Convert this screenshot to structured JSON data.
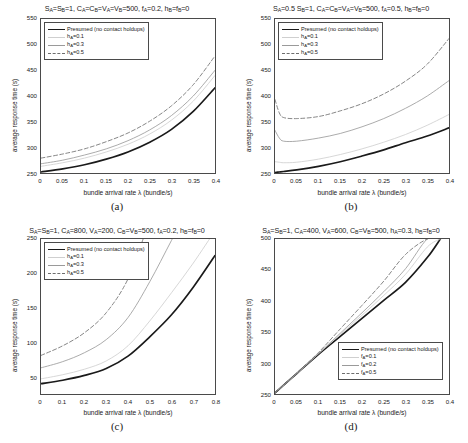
{
  "figure": {
    "axis_labels": {
      "x": "bundle arrival rate λ (bundle/s)",
      "y": "average response time (s)"
    },
    "series_styles": {
      "presumed": "#1a1a1a",
      "light_gray": "#cfcfcf",
      "mid_gray": "#9a9a9a",
      "dashed_gray": "#6e6e6e"
    }
  },
  "panels": [
    {
      "id": "a",
      "caption": "(a)",
      "title_html": "S<sub>A</sub>=S<sub>B</sub>=1, C<sub>A</sub>=C<sub>B</sub>=V<sub>A</sub>=V<sub>B</sub>=500, f<sub>A</sub>=0.2, h<sub>B</sub>=f<sub>B</sub>=0",
      "chart_data": {
        "type": "line",
        "title": "S_A=S_B=1, C_A=C_B=V_A=V_B=500, f_A=0.2, h_B=f_B=0",
        "xlabel": "bundle arrival rate λ (bundle/s)",
        "ylabel": "average response time (s)",
        "xlim": [
          0,
          0.4
        ],
        "ylim": [
          250,
          550
        ],
        "xticks": [
          0,
          0.05,
          0.1,
          0.15,
          0.2,
          0.25,
          0.3,
          0.35,
          0.4
        ],
        "xticklabels": [
          "0",
          "0.05",
          "0.1",
          "0.15",
          "0.2",
          "0.25",
          "0.3",
          "0.35",
          "0.4"
        ],
        "yticks": [
          250,
          300,
          350,
          400,
          450,
          500,
          550
        ],
        "yticklabels": [
          "250",
          "300",
          "350",
          "400",
          "450",
          "500",
          "550"
        ],
        "grid": false,
        "legend_position": "upper left",
        "x": [
          0,
          0.05,
          0.1,
          0.15,
          0.2,
          0.25,
          0.3,
          0.35,
          0.4
        ],
        "series": [
          {
            "name": "Presumed (no contact holdups)",
            "style": "solid-thick",
            "color": "#1a1a1a",
            "values": [
              252,
              258,
              266,
              277,
              291,
              310,
              335,
              370,
              416
            ]
          },
          {
            "name": "h_A=0.1",
            "style": "solid-thin",
            "color": "#cfcfcf",
            "values": [
              263,
              270,
              279,
              291,
              306,
              326,
              353,
              390,
              440
            ]
          },
          {
            "name": "h_A=0.3",
            "style": "solid-thin",
            "color": "#9a9a9a",
            "values": [
              268,
              275,
              285,
              297,
              313,
              334,
              362,
              400,
              450
            ]
          },
          {
            "name": "h_A=0.5",
            "style": "dashed",
            "color": "#6e6e6e",
            "values": [
              279,
              287,
              297,
              311,
              328,
              351,
              381,
              422,
              478
            ]
          }
        ]
      },
      "legend": [
        {
          "label_html": "Presumed (no contact holdups)",
          "style": "solid-thick",
          "color": "#1a1a1a"
        },
        {
          "label_html": "h<sub>A</sub>=0.1",
          "style": "solid-thin",
          "color": "#cfcfcf"
        },
        {
          "label_html": "h<sub>A</sub>=0.3",
          "style": "solid-thin",
          "color": "#9a9a9a"
        },
        {
          "label_html": "h<sub>A</sub>=0.5",
          "style": "dashed",
          "color": "#6e6e6e"
        }
      ]
    },
    {
      "id": "b",
      "caption": "(b)",
      "title_html": "S<sub>A</sub>=0.5 S<sub>B</sub>=1, C<sub>A</sub>=C<sub>B</sub>=V<sub>A</sub>=V<sub>B</sub>=500, f<sub>A</sub>=0.5, h<sub>B</sub>=f<sub>B</sub>=0",
      "chart_data": {
        "type": "line",
        "title": "S_A=0.5 S_B=1, C_A=C_B=V_A=V_B=500, f_A=0.5, h_B=f_B=0",
        "xlabel": "bundle arrival rate λ (bundle/s)",
        "ylabel": "average response time (s)",
        "xlim": [
          0,
          0.4
        ],
        "ylim": [
          250,
          550
        ],
        "xticks": [
          0,
          0.05,
          0.1,
          0.15,
          0.2,
          0.25,
          0.3,
          0.35,
          0.4
        ],
        "xticklabels": [
          "0",
          "0.05",
          "0.1",
          "0.15",
          "0.2",
          "0.25",
          "0.3",
          "0.35",
          "0.4"
        ],
        "yticks": [
          250,
          300,
          350,
          400,
          450,
          500,
          550
        ],
        "yticklabels": [
          "250",
          "300",
          "350",
          "400",
          "450",
          "500",
          "550"
        ],
        "grid": false,
        "legend_position": "upper left",
        "x": [
          0,
          0.01,
          0.02,
          0.05,
          0.1,
          0.15,
          0.2,
          0.25,
          0.3,
          0.35,
          0.4
        ],
        "series": [
          {
            "name": "Presumed (no contact holdups)",
            "style": "solid-thick",
            "color": "#1a1a1a",
            "values": [
              251,
              252,
              253,
              256,
              263,
              272,
              283,
              295,
              309,
              322,
              338
            ]
          },
          {
            "name": "h_A=0.1",
            "style": "solid-thin",
            "color": "#cfcfcf",
            "values": [
              272,
              271,
              270,
              271,
              277,
              286,
              297,
              310,
              325,
              343,
              364
            ]
          },
          {
            "name": "h_A=0.3",
            "style": "solid-thin",
            "color": "#9a9a9a",
            "values": [
              333,
              318,
              312,
              312,
              318,
              327,
              340,
              356,
              376,
              400,
              430
            ]
          },
          {
            "name": "h_A=0.5",
            "style": "dashed",
            "color": "#6e6e6e",
            "values": [
              393,
              367,
              358,
              356,
              360,
              371,
              385,
              404,
              429,
              462,
              512
            ]
          }
        ]
      },
      "legend": [
        {
          "label_html": "Presumed (no contact holdups)",
          "style": "solid-thick",
          "color": "#1a1a1a"
        },
        {
          "label_html": "h<sub>A</sub>=0.1",
          "style": "solid-thin",
          "color": "#cfcfcf"
        },
        {
          "label_html": "h<sub>A</sub>=0.3",
          "style": "solid-thin",
          "color": "#9a9a9a"
        },
        {
          "label_html": "h<sub>A</sub>=0.5",
          "style": "dashed",
          "color": "#6e6e6e"
        }
      ]
    },
    {
      "id": "c",
      "caption": "(c)",
      "title_html": "S<sub>A</sub>=S<sub>B</sub>=1, C<sub>A</sub>=800, V<sub>A</sub>=200, C<sub>B</sub>=V<sub>B</sub>=500, f<sub>A</sub>=0.2, h<sub>B</sub>=f<sub>B</sub>=0",
      "chart_data": {
        "type": "line",
        "title": "S_A=S_B=1, C_A=800, V_A=200, C_B=V_B=500, f_A=0.2, h_B=f_B=0",
        "xlabel": "bundle arrival rate λ (bundle/s)",
        "ylabel": "average response time (s)",
        "xlim": [
          0,
          0.8
        ],
        "ylim": [
          25,
          250
        ],
        "xticks": [
          0,
          0.1,
          0.2,
          0.3,
          0.4,
          0.5,
          0.6,
          0.7,
          0.8
        ],
        "xticklabels": [
          "0",
          "0.1",
          "0.2",
          "0.3",
          "0.4",
          "0.5",
          "0.6",
          "0.7",
          "0.8"
        ],
        "yticks": [
          50,
          100,
          150,
          200,
          250
        ],
        "yticklabels": [
          "50",
          "100",
          "150",
          "200",
          "250"
        ],
        "grid": false,
        "legend_position": "upper left",
        "x": [
          0,
          0.1,
          0.2,
          0.3,
          0.4,
          0.5,
          0.6,
          0.7,
          0.8
        ],
        "series": [
          {
            "name": "Presumed (no contact holdups)",
            "style": "solid-thick",
            "color": "#1a1a1a",
            "values": [
              40,
              45,
              52,
              62,
              80,
              108,
              140,
              180,
              226
            ]
          },
          {
            "name": "h_A=0.1",
            "style": "solid-thin",
            "color": "#cfcfcf",
            "values": [
              47,
              53,
              61,
              73,
              95,
              131,
              172,
              215,
              262
            ]
          },
          {
            "name": "h_A=0.3",
            "style": "solid-thin",
            "color": "#9a9a9a",
            "values": [
              63,
              72,
              85,
              104,
              136,
              188,
              248,
              312,
              380
            ]
          },
          {
            "name": "h_A=0.5",
            "style": "dashed",
            "color": "#6e6e6e",
            "values": [
              81,
              95,
              114,
              143,
              192,
              272,
              360,
              450,
              545
            ]
          }
        ]
      },
      "legend": [
        {
          "label_html": "Presumed (no contact holdups)",
          "style": "solid-thick",
          "color": "#1a1a1a"
        },
        {
          "label_html": "h<sub>A</sub>=0.1",
          "style": "solid-thin",
          "color": "#cfcfcf"
        },
        {
          "label_html": "h<sub>A</sub>=0.3",
          "style": "solid-thin",
          "color": "#9a9a9a"
        },
        {
          "label_html": "h<sub>A</sub>=0.5",
          "style": "dashed",
          "color": "#6e6e6e"
        }
      ]
    },
    {
      "id": "d",
      "caption": "(d)",
      "title_html": "S<sub>A</sub>=S<sub>B</sub>=1, C<sub>A</sub>=400, V<sub>A</sub>=600, C<sub>B</sub>=V<sub>B</sub>=500, h<sub>A</sub>=0.3, h<sub>B</sub>=f<sub>B</sub>=0",
      "chart_data": {
        "type": "line",
        "title": "S_A=S_B=1, C_A=400, V_A=600, C_B=V_B=500, h_A=0.3, h_B=f_B=0",
        "xlabel": "bundle arrival rate λ (bundle/s)",
        "ylabel": "average response time (s)",
        "xlim": [
          0,
          0.4
        ],
        "ylim": [
          250,
          500
        ],
        "xticks": [
          0,
          0.05,
          0.1,
          0.15,
          0.2,
          0.25,
          0.3,
          0.35,
          0.4
        ],
        "xticklabels": [
          "0",
          "0.05",
          "0.1",
          "0.15",
          "0.2",
          "0.25",
          "0.3",
          "0.35",
          "0.4"
        ],
        "yticks": [
          250,
          300,
          350,
          400,
          450,
          500
        ],
        "yticklabels": [
          "250",
          "300",
          "350",
          "400",
          "450",
          "500"
        ],
        "grid": false,
        "legend_position": "lower right",
        "x": [
          0,
          0.05,
          0.1,
          0.15,
          0.2,
          0.25,
          0.3,
          0.35,
          0.38
        ],
        "series": [
          {
            "name": "Presumed (no contact holdups)",
            "style": "solid-thick",
            "color": "#1a1a1a",
            "values": [
              252,
              283,
              314,
              343,
              372,
              401,
              430,
              470,
              500
            ]
          },
          {
            "name": "f_A=0.1",
            "style": "solid-thin",
            "color": "#cfcfcf",
            "values": [
              252,
              283,
              315,
              346,
              377,
              409,
              443,
              487,
              500
            ]
          },
          {
            "name": "f_A=0.2",
            "style": "solid-thin",
            "color": "#9a9a9a",
            "values": [
              252,
              283,
              315,
              348,
              381,
              415,
              452,
              500,
              500
            ]
          },
          {
            "name": "f_A=0.5",
            "style": "dashed",
            "color": "#6e6e6e",
            "values": [
              252,
              284,
              317,
              355,
              393,
              432,
              475,
              500,
              500
            ]
          }
        ]
      },
      "legend": [
        {
          "label_html": "Presumed (no contact holdups)",
          "style": "solid-thick",
          "color": "#1a1a1a"
        },
        {
          "label_html": "f<sub>A</sub>=0.1",
          "style": "solid-thin",
          "color": "#cfcfcf"
        },
        {
          "label_html": "f<sub>A</sub>=0.2",
          "style": "solid-thin",
          "color": "#9a9a9a"
        },
        {
          "label_html": "f<sub>A</sub>=0.5",
          "style": "dashed",
          "color": "#6e6e6e"
        }
      ]
    }
  ]
}
